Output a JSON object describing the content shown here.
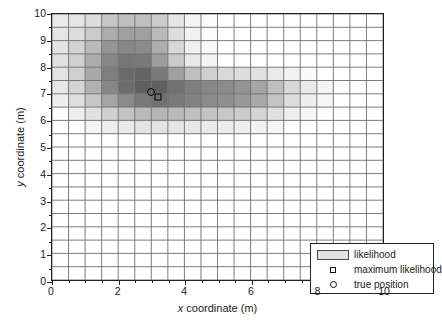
{
  "chart_data": {
    "type": "heatmap",
    "title": "",
    "xlabel_plain": "x coordinate (m)",
    "ylabel_plain": "y coordinate (m)",
    "xlabel_symbol": "x",
    "xlabel_rest": " coordinate (m)",
    "ylabel_symbol": "y",
    "ylabel_rest": " coordinate (m)",
    "xlim": [
      0,
      10
    ],
    "ylim": [
      0,
      10
    ],
    "xticks": [
      0,
      2,
      4,
      6,
      8,
      10
    ],
    "yticks": [
      0,
      1,
      2,
      3,
      4,
      5,
      6,
      7,
      8,
      9,
      10
    ],
    "xtick_labels": [
      "0",
      "2",
      "4",
      "6",
      "8",
      "10"
    ],
    "ytick_labels": [
      "0",
      "1",
      "2",
      "3",
      "4",
      "5",
      "6",
      "7",
      "8",
      "9",
      "10"
    ],
    "minor_tick_step": 0.5,
    "grid": true,
    "grid_step": 0.5,
    "cell_size": 0.5,
    "colormap": "grayscale-inverted",
    "value_range": [
      0,
      1
    ],
    "legend_position": "lower-right",
    "cells": [
      {
        "x": 0.0,
        "y": 9.5,
        "v": 0.1
      },
      {
        "x": 0.5,
        "y": 9.5,
        "v": 0.12
      },
      {
        "x": 1.0,
        "y": 9.5,
        "v": 0.16
      },
      {
        "x": 1.5,
        "y": 9.5,
        "v": 0.26
      },
      {
        "x": 2.0,
        "y": 9.5,
        "v": 0.3
      },
      {
        "x": 2.5,
        "y": 9.5,
        "v": 0.3
      },
      {
        "x": 3.0,
        "y": 9.5,
        "v": 0.24
      },
      {
        "x": 3.5,
        "y": 9.5,
        "v": 0.12
      },
      {
        "x": 4.0,
        "y": 9.5,
        "v": 0.05
      },
      {
        "x": 4.5,
        "y": 9.5,
        "v": 0.02
      },
      {
        "x": 0.0,
        "y": 9.0,
        "v": 0.12
      },
      {
        "x": 0.5,
        "y": 9.0,
        "v": 0.16
      },
      {
        "x": 1.0,
        "y": 9.0,
        "v": 0.24
      },
      {
        "x": 1.5,
        "y": 9.0,
        "v": 0.38
      },
      {
        "x": 2.0,
        "y": 9.0,
        "v": 0.44
      },
      {
        "x": 2.5,
        "y": 9.0,
        "v": 0.44
      },
      {
        "x": 3.0,
        "y": 9.0,
        "v": 0.32
      },
      {
        "x": 3.5,
        "y": 9.0,
        "v": 0.16
      },
      {
        "x": 4.0,
        "y": 9.0,
        "v": 0.06
      },
      {
        "x": 4.5,
        "y": 9.0,
        "v": 0.02
      },
      {
        "x": 0.0,
        "y": 8.5,
        "v": 0.13
      },
      {
        "x": 0.5,
        "y": 8.5,
        "v": 0.2
      },
      {
        "x": 1.0,
        "y": 8.5,
        "v": 0.32
      },
      {
        "x": 1.5,
        "y": 8.5,
        "v": 0.5
      },
      {
        "x": 2.0,
        "y": 8.5,
        "v": 0.56
      },
      {
        "x": 2.5,
        "y": 8.5,
        "v": 0.54
      },
      {
        "x": 3.0,
        "y": 8.5,
        "v": 0.38
      },
      {
        "x": 3.5,
        "y": 8.5,
        "v": 0.18
      },
      {
        "x": 4.0,
        "y": 8.5,
        "v": 0.07
      },
      {
        "x": 4.5,
        "y": 8.5,
        "v": 0.03
      },
      {
        "x": 0.0,
        "y": 8.0,
        "v": 0.14
      },
      {
        "x": 0.5,
        "y": 8.0,
        "v": 0.22
      },
      {
        "x": 1.0,
        "y": 8.0,
        "v": 0.38
      },
      {
        "x": 1.5,
        "y": 8.0,
        "v": 0.56
      },
      {
        "x": 2.0,
        "y": 8.0,
        "v": 0.64
      },
      {
        "x": 2.5,
        "y": 8.0,
        "v": 0.62
      },
      {
        "x": 3.0,
        "y": 8.0,
        "v": 0.46
      },
      {
        "x": 3.5,
        "y": 8.0,
        "v": 0.24
      },
      {
        "x": 4.0,
        "y": 8.0,
        "v": 0.11
      },
      {
        "x": 4.5,
        "y": 8.0,
        "v": 0.05
      },
      {
        "x": 0.0,
        "y": 7.5,
        "v": 0.13
      },
      {
        "x": 0.5,
        "y": 7.5,
        "v": 0.22
      },
      {
        "x": 1.0,
        "y": 7.5,
        "v": 0.4
      },
      {
        "x": 1.5,
        "y": 7.5,
        "v": 0.6
      },
      {
        "x": 2.0,
        "y": 7.5,
        "v": 0.7
      },
      {
        "x": 2.5,
        "y": 7.5,
        "v": 0.72
      },
      {
        "x": 3.0,
        "y": 7.5,
        "v": 0.62
      },
      {
        "x": 3.5,
        "y": 7.5,
        "v": 0.44
      },
      {
        "x": 4.0,
        "y": 7.5,
        "v": 0.3
      },
      {
        "x": 4.5,
        "y": 7.5,
        "v": 0.22
      },
      {
        "x": 5.0,
        "y": 7.5,
        "v": 0.18
      },
      {
        "x": 5.5,
        "y": 7.5,
        "v": 0.16
      },
      {
        "x": 6.0,
        "y": 7.5,
        "v": 0.14
      },
      {
        "x": 6.5,
        "y": 7.5,
        "v": 0.1
      },
      {
        "x": 7.0,
        "y": 7.5,
        "v": 0.06
      },
      {
        "x": 7.5,
        "y": 7.5,
        "v": 0.03
      },
      {
        "x": 0.0,
        "y": 7.0,
        "v": 0.11
      },
      {
        "x": 0.5,
        "y": 7.0,
        "v": 0.2
      },
      {
        "x": 1.0,
        "y": 7.0,
        "v": 0.36
      },
      {
        "x": 1.5,
        "y": 7.0,
        "v": 0.56
      },
      {
        "x": 2.0,
        "y": 7.0,
        "v": 0.68
      },
      {
        "x": 2.5,
        "y": 7.0,
        "v": 0.74
      },
      {
        "x": 3.0,
        "y": 7.0,
        "v": 0.74
      },
      {
        "x": 3.5,
        "y": 7.0,
        "v": 0.66
      },
      {
        "x": 4.0,
        "y": 7.0,
        "v": 0.6
      },
      {
        "x": 4.5,
        "y": 7.0,
        "v": 0.56
      },
      {
        "x": 5.0,
        "y": 7.0,
        "v": 0.54
      },
      {
        "x": 5.5,
        "y": 7.0,
        "v": 0.5
      },
      {
        "x": 6.0,
        "y": 7.0,
        "v": 0.42
      },
      {
        "x": 6.5,
        "y": 7.0,
        "v": 0.3
      },
      {
        "x": 7.0,
        "y": 7.0,
        "v": 0.18
      },
      {
        "x": 7.5,
        "y": 7.0,
        "v": 0.1
      },
      {
        "x": 8.0,
        "y": 7.0,
        "v": 0.05
      },
      {
        "x": 8.5,
        "y": 7.0,
        "v": 0.02
      },
      {
        "x": 0.0,
        "y": 6.5,
        "v": 0.08
      },
      {
        "x": 0.5,
        "y": 6.5,
        "v": 0.15
      },
      {
        "x": 1.0,
        "y": 6.5,
        "v": 0.26
      },
      {
        "x": 1.5,
        "y": 6.5,
        "v": 0.42
      },
      {
        "x": 2.0,
        "y": 6.5,
        "v": 0.54
      },
      {
        "x": 2.5,
        "y": 6.5,
        "v": 0.62
      },
      {
        "x": 3.0,
        "y": 6.5,
        "v": 0.66
      },
      {
        "x": 3.5,
        "y": 6.5,
        "v": 0.62
      },
      {
        "x": 4.0,
        "y": 6.5,
        "v": 0.58
      },
      {
        "x": 4.5,
        "y": 6.5,
        "v": 0.54
      },
      {
        "x": 5.0,
        "y": 6.5,
        "v": 0.52
      },
      {
        "x": 5.5,
        "y": 6.5,
        "v": 0.48
      },
      {
        "x": 6.0,
        "y": 6.5,
        "v": 0.4
      },
      {
        "x": 6.5,
        "y": 6.5,
        "v": 0.28
      },
      {
        "x": 7.0,
        "y": 6.5,
        "v": 0.16
      },
      {
        "x": 7.5,
        "y": 6.5,
        "v": 0.08
      },
      {
        "x": 8.0,
        "y": 6.5,
        "v": 0.04
      },
      {
        "x": 0.5,
        "y": 6.0,
        "v": 0.08
      },
      {
        "x": 1.0,
        "y": 6.0,
        "v": 0.14
      },
      {
        "x": 1.5,
        "y": 6.0,
        "v": 0.22
      },
      {
        "x": 2.0,
        "y": 6.0,
        "v": 0.28
      },
      {
        "x": 2.5,
        "y": 6.0,
        "v": 0.32
      },
      {
        "x": 3.0,
        "y": 6.0,
        "v": 0.34
      },
      {
        "x": 3.5,
        "y": 6.0,
        "v": 0.32
      },
      {
        "x": 4.0,
        "y": 6.0,
        "v": 0.3
      },
      {
        "x": 4.5,
        "y": 6.0,
        "v": 0.28
      },
      {
        "x": 5.0,
        "y": 6.0,
        "v": 0.26
      },
      {
        "x": 5.5,
        "y": 6.0,
        "v": 0.24
      },
      {
        "x": 6.0,
        "y": 6.0,
        "v": 0.2
      },
      {
        "x": 6.5,
        "y": 6.0,
        "v": 0.14
      },
      {
        "x": 7.0,
        "y": 6.0,
        "v": 0.08
      },
      {
        "x": 7.5,
        "y": 6.0,
        "v": 0.04
      },
      {
        "x": 1.0,
        "y": 5.5,
        "v": 0.05
      },
      {
        "x": 1.5,
        "y": 5.5,
        "v": 0.08
      },
      {
        "x": 2.0,
        "y": 5.5,
        "v": 0.1
      },
      {
        "x": 2.5,
        "y": 5.5,
        "v": 0.12
      },
      {
        "x": 3.0,
        "y": 5.5,
        "v": 0.13
      },
      {
        "x": 3.5,
        "y": 5.5,
        "v": 0.12
      },
      {
        "x": 4.0,
        "y": 5.5,
        "v": 0.11
      },
      {
        "x": 4.5,
        "y": 5.5,
        "v": 0.1
      },
      {
        "x": 5.0,
        "y": 5.5,
        "v": 0.09
      },
      {
        "x": 5.5,
        "y": 5.5,
        "v": 0.08
      },
      {
        "x": 6.0,
        "y": 5.5,
        "v": 0.06
      },
      {
        "x": 6.5,
        "y": 5.5,
        "v": 0.04
      }
    ],
    "markers": [
      {
        "name": "true position",
        "symbol": "circle",
        "x": 2.98,
        "y": 7.08
      },
      {
        "name": "maximum likelihood",
        "symbol": "square",
        "x": 3.18,
        "y": 6.92
      }
    ],
    "legend": {
      "entries": [
        {
          "key": "swatch",
          "label": "likelihood"
        },
        {
          "key": "square",
          "label": "maximum likelihood"
        },
        {
          "key": "circle",
          "label": "true position"
        }
      ]
    }
  }
}
